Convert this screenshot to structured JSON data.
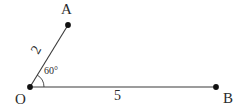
{
  "figure": {
    "type": "geometry-diagram",
    "background_color": "#ffffff",
    "stroke_color": "#3a3a3a",
    "text_color": "#2b2b2b"
  },
  "points": [
    {
      "id": "O",
      "label": "O",
      "x": 30,
      "y": 87
    },
    {
      "id": "A",
      "label": "A",
      "x": 68,
      "y": 25
    },
    {
      "id": "B",
      "label": "B",
      "x": 216,
      "y": 87
    }
  ],
  "segments": [
    {
      "id": "OA",
      "from": "O",
      "to": "A",
      "length_label": "2"
    },
    {
      "id": "OB",
      "from": "O",
      "to": "B",
      "length_label": "5"
    }
  ],
  "angles": [
    {
      "id": "AOB",
      "vertex": "O",
      "label": "60°",
      "value": 60,
      "unit": "degrees",
      "arc_radius": 14
    }
  ],
  "labels": {
    "vertex_A": "A",
    "vertex_B": "B",
    "vertex_O": "O",
    "side_OA": "2",
    "side_OB": "5",
    "angle_O": "60°"
  }
}
